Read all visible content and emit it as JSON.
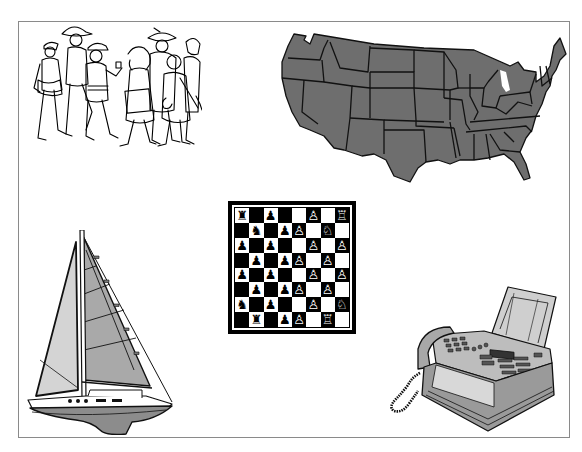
{
  "canvas": {
    "width": 582,
    "height": 452,
    "background": "#ffffff",
    "frame_color": "#8a8a8a"
  },
  "clipart": [
    {
      "id": "people",
      "label": "crowd-of-people-line-drawing",
      "style": "black line art on white"
    },
    {
      "id": "usmap",
      "label": "united-states-map",
      "fill": "#6e6e6e",
      "stroke": "#111111"
    },
    {
      "id": "chess",
      "label": "chessboard"
    },
    {
      "id": "sailboat",
      "label": "sailboat",
      "sail_light": "#d4d4d4",
      "sail_dark": "#a9a9a9",
      "hull": "#8c8c8c"
    },
    {
      "id": "fax",
      "label": "fax-machine",
      "body": "#bdbdbd",
      "shade": "#8e8e8e"
    }
  ],
  "chess": {
    "top_left_square": "light",
    "rows": [
      [
        "♜",
        "",
        "♟",
        "",
        "",
        "♙",
        "",
        "♖"
      ],
      [
        "",
        "♞",
        "",
        "♟",
        "♙",
        "",
        "♘",
        ""
      ],
      [
        "♟",
        "",
        "♟",
        "",
        "",
        "♙",
        "",
        "♙"
      ],
      [
        "",
        "♟",
        "",
        "♟",
        "♙",
        "",
        "♙",
        ""
      ],
      [
        "♟",
        "",
        "♟",
        "",
        "",
        "♙",
        "",
        "♙"
      ],
      [
        "",
        "♟",
        "",
        "♟",
        "♙",
        "",
        "♙",
        ""
      ],
      [
        "♞",
        "",
        "♟",
        "",
        "",
        "♙",
        "",
        "♘"
      ],
      [
        "",
        "♜",
        "",
        "♟",
        "♙",
        "",
        "♖",
        ""
      ]
    ]
  }
}
